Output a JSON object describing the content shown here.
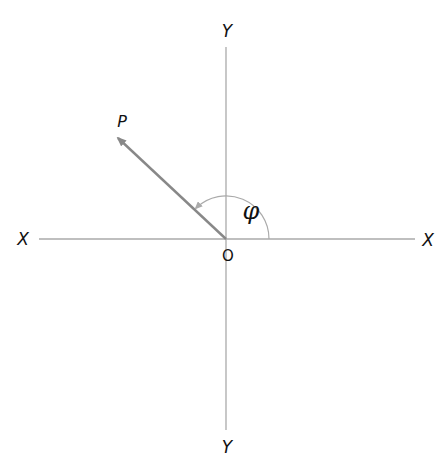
{
  "diagram": {
    "type": "polar-angle-axes",
    "labels": {
      "y_top": "Y",
      "y_bottom": "Y",
      "x_left": "X",
      "x_right": "X",
      "origin": "O",
      "point": "P",
      "angle": "φ"
    },
    "colors": {
      "axis": "#aaaaaa",
      "vector": "#888888",
      "arc": "#aaaaaa",
      "text": "#111111"
    },
    "geometry": {
      "origin": [
        226,
        239
      ],
      "vector_tip": [
        116,
        136
      ],
      "arc_radius": 43
    }
  }
}
